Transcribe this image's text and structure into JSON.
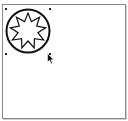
{
  "canvas": {
    "background": "#ffffff",
    "border_color": "#8a8a8a"
  },
  "shape": {
    "type": "circle-with-star",
    "circle": {
      "cx": 28,
      "cy": 31,
      "r": 21.5,
      "stroke": "#111111",
      "stroke_width": 2
    },
    "star": {
      "points": 9,
      "cx": 28,
      "cy": 31,
      "outer_r": 18,
      "inner_r": 10,
      "stroke": "#111111",
      "stroke_width": 1.2,
      "fill": "#ffffff"
    },
    "selected": true
  },
  "selection_handles": [
    {
      "x": 5,
      "y": 8
    },
    {
      "x": 49,
      "y": 8
    },
    {
      "x": 5,
      "y": 53
    },
    {
      "x": 49,
      "y": 53
    }
  ],
  "cursor": {
    "type": "arrow-pointer",
    "x": 47,
    "y": 53
  }
}
